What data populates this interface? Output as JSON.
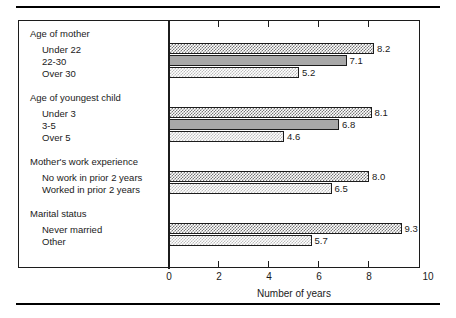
{
  "chart_data": {
    "type": "bar",
    "orientation": "horizontal",
    "title": "",
    "xlabel": "Number of years",
    "ylabel": "",
    "xlim": [
      0,
      10
    ],
    "xticks": [
      "0",
      "2",
      "4",
      "6",
      "8",
      "10"
    ],
    "grid": false,
    "legend": "none",
    "value_unit": "years",
    "groups": [
      {
        "title": "Age of mother",
        "categories": [
          "Under 22",
          "22-30",
          "Over 30"
        ],
        "values": [
          8.2,
          7.1,
          5.2
        ],
        "value_labels": [
          "8.2",
          "7.1",
          "5.2"
        ],
        "fills": [
          "checkerboard-dark",
          "solid-gray",
          "dither-light"
        ]
      },
      {
        "title": "Age of youngest child",
        "categories": [
          "Under 3",
          "3-5",
          "Over 5"
        ],
        "values": [
          8.1,
          6.8,
          4.6
        ],
        "value_labels": [
          "8.1",
          "6.8",
          "4.6"
        ],
        "fills": [
          "checkerboard-dark",
          "solid-gray",
          "dither-light"
        ]
      },
      {
        "title": "Mother's work experience",
        "categories": [
          "No work in prior 2 years",
          "Worked in prior 2 years"
        ],
        "values": [
          8.0,
          6.5
        ],
        "value_labels": [
          "8.0",
          "6.5"
        ],
        "fills": [
          "checkerboard-dark",
          "dither-light"
        ]
      },
      {
        "title": "Marital status",
        "categories": [
          "Never married",
          "Other"
        ],
        "values": [
          9.3,
          5.7
        ],
        "value_labels": [
          "9.3",
          "5.7"
        ],
        "fills": [
          "checkerboard-dark",
          "dither-light"
        ]
      }
    ],
    "categories": [
      "Under 22",
      "22-30",
      "Over 30",
      "Under 3",
      "3-5",
      "Over 5",
      "No work in prior 2 years",
      "Worked in prior 2 years",
      "Never married",
      "Other"
    ],
    "values": [
      8.2,
      7.1,
      5.2,
      8.1,
      6.8,
      4.6,
      8.0,
      6.5,
      9.3,
      5.7
    ],
    "colors": {
      "axis": "#1c1c1c",
      "bar_outline": "#1c1c1c",
      "fill_dark": "#777777",
      "fill_solid": "#a8a8a8",
      "fill_light": "#bdbdbd",
      "background": "#ffffff"
    }
  }
}
